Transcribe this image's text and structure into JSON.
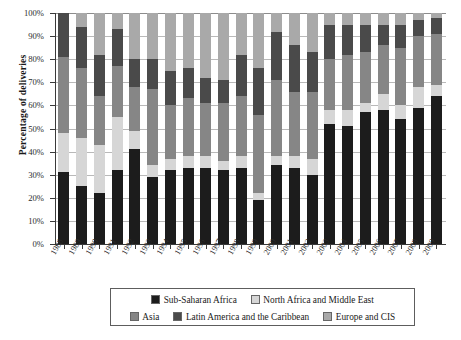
{
  "chart_data": {
    "type": "bar",
    "subtype": "stacked-100-percent",
    "title": "",
    "xlabel": "",
    "ylabel": "Percentage of deliveries",
    "ylim": [
      0,
      100
    ],
    "yticks": [
      "0%",
      "10%",
      "20%",
      "30%",
      "40%",
      "50%",
      "60%",
      "70%",
      "80%",
      "90%",
      "100%"
    ],
    "grid": true,
    "legend_position": "bottom",
    "categories": [
      "1988",
      "1989",
      "1990",
      "1991",
      "1992",
      "1993",
      "1994",
      "1995",
      "1996",
      "1997",
      "1998",
      "1999",
      "2000",
      "2001",
      "2002",
      "2003",
      "2004",
      "2005",
      "2006",
      "2007",
      "2008",
      "2009"
    ],
    "series": [
      {
        "name": "Sub-Saharan Africa",
        "color": "#1c1c1c",
        "values": [
          31,
          25,
          22,
          32,
          41,
          29,
          32,
          33,
          33,
          32,
          33,
          19,
          34,
          33,
          30,
          52,
          51,
          57,
          58,
          54,
          59,
          64
        ]
      },
      {
        "name": "North Africa and Middle East",
        "color": "#d6d6d6",
        "values": [
          17,
          21,
          21,
          23,
          8,
          5,
          5,
          5,
          5,
          4,
          5,
          3,
          4,
          5,
          7,
          6,
          7,
          4,
          7,
          6,
          9,
          5
        ]
      },
      {
        "name": "Asia",
        "color": "#868686",
        "values": [
          33,
          30,
          21,
          22,
          19,
          33,
          23,
          25,
          23,
          25,
          26,
          34,
          33,
          28,
          29,
          22,
          24,
          22,
          21,
          25,
          22,
          22
        ]
      },
      {
        "name": "Latin America and the Caribbean",
        "color": "#4a4a4a",
        "values": [
          19,
          18,
          18,
          16,
          12,
          13,
          15,
          13,
          11,
          10,
          18,
          20,
          21,
          20,
          17,
          15,
          13,
          12,
          9,
          10,
          7,
          7
        ]
      },
      {
        "name": "Europe and CIS",
        "color": "#a9a9a9",
        "values": [
          0,
          6,
          18,
          7,
          20,
          20,
          25,
          24,
          28,
          29,
          18,
          24,
          8,
          14,
          17,
          5,
          5,
          5,
          5,
          5,
          3,
          2
        ]
      }
    ]
  },
  "legend": {
    "row1": [
      {
        "label": "Sub-Saharan Africa",
        "color": "#1c1c1c"
      },
      {
        "label": "North Africa and Middle East",
        "color": "#d6d6d6"
      }
    ],
    "row2": [
      {
        "label": "Asia",
        "color": "#868686"
      },
      {
        "label": "Latin America and the Caribbean",
        "color": "#4a4a4a"
      },
      {
        "label": "Europe and CIS",
        "color": "#a9a9a9"
      }
    ]
  }
}
